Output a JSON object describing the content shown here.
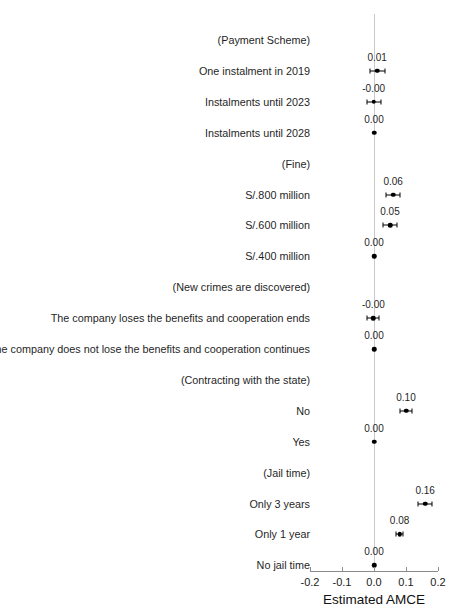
{
  "chart_data": {
    "type": "scatter",
    "title": "",
    "xlabel": "Estimated AMCE",
    "ylabel": "",
    "xlim": [
      -0.2,
      0.2
    ],
    "xticks": [
      "-0.2",
      "-0.1",
      "0.0",
      "0.1",
      "0.2"
    ],
    "xtick_values": [
      -0.2,
      -0.1,
      0.0,
      0.1,
      0.2
    ],
    "grid": false,
    "legend": null,
    "zero_reference_line": 0.0,
    "rows": [
      {
        "label": "(Payment Scheme)",
        "kind": "group",
        "estimate": null,
        "estimate_label": null,
        "ci_low": null,
        "ci_high": null
      },
      {
        "label": "One instalment in 2019",
        "kind": "level",
        "estimate": 0.01,
        "estimate_label": "0.01",
        "ci_low": -0.013,
        "ci_high": 0.033
      },
      {
        "label": "Instalments until 2023",
        "kind": "level",
        "estimate": -0.001,
        "estimate_label": "-0.00",
        "ci_low": -0.023,
        "ci_high": 0.022
      },
      {
        "label": "Instalments until 2028",
        "kind": "level",
        "estimate": 0.0,
        "estimate_label": "0.00",
        "ci_low": 0.0,
        "ci_high": 0.0
      },
      {
        "label": "(Fine)",
        "kind": "group",
        "estimate": null,
        "estimate_label": null,
        "ci_low": null,
        "ci_high": null
      },
      {
        "label": "S/.800 million",
        "kind": "level",
        "estimate": 0.06,
        "estimate_label": "0.06",
        "ci_low": 0.038,
        "ci_high": 0.082
      },
      {
        "label": "S/.600 million",
        "kind": "level",
        "estimate": 0.05,
        "estimate_label": "0.05",
        "ci_low": 0.028,
        "ci_high": 0.072
      },
      {
        "label": "S/.400 million",
        "kind": "level",
        "estimate": 0.0,
        "estimate_label": "0.00",
        "ci_low": 0.0,
        "ci_high": 0.0
      },
      {
        "label": "(New crimes are discovered)",
        "kind": "group",
        "estimate": null,
        "estimate_label": null,
        "ci_low": null,
        "ci_high": null
      },
      {
        "label": "The company loses the benefits and cooperation ends",
        "kind": "level",
        "estimate": -0.002,
        "estimate_label": "-0.00",
        "ci_low": -0.021,
        "ci_high": 0.017
      },
      {
        "label": "The company does not lose the benefits and cooperation continues",
        "kind": "level",
        "estimate": 0.0,
        "estimate_label": "0.00",
        "ci_low": 0.0,
        "ci_high": 0.0
      },
      {
        "label": "(Contracting with the state)",
        "kind": "group",
        "estimate": null,
        "estimate_label": null,
        "ci_low": null,
        "ci_high": null
      },
      {
        "label": "No",
        "kind": "level",
        "estimate": 0.1,
        "estimate_label": "0.10",
        "ci_low": 0.081,
        "ci_high": 0.119
      },
      {
        "label": "Yes",
        "kind": "level",
        "estimate": 0.0,
        "estimate_label": "0.00",
        "ci_low": 0.0,
        "ci_high": 0.0
      },
      {
        "label": "(Jail time)",
        "kind": "group",
        "estimate": null,
        "estimate_label": null,
        "ci_low": null,
        "ci_high": null
      },
      {
        "label": "Only 3 years",
        "kind": "level",
        "estimate": 0.16,
        "estimate_label": "0.16",
        "ci_low": 0.138,
        "ci_high": 0.182
      },
      {
        "label": "Only 1 year",
        "kind": "level",
        "estimate": 0.08,
        "estimate_label": "0.08",
        "ci_low": 0.069,
        "ci_high": 0.091
      },
      {
        "label": "No jail time",
        "kind": "level",
        "estimate": 0.0,
        "estimate_label": "0.00",
        "ci_low": 0.0,
        "ci_high": 0.0
      }
    ]
  },
  "colors": {
    "point": "#000000",
    "zero_line": "#c9c9c9",
    "axis": "#8a8a8a",
    "text": "#1f1f1f",
    "background": "#ffffff"
  }
}
